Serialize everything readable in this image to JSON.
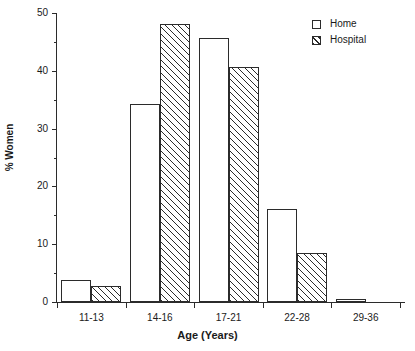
{
  "chart_data": {
    "type": "bar",
    "title": "",
    "subtitle": "",
    "xlabel": "Age (Years)",
    "ylabel": "% Women",
    "categories": [
      "11-13",
      "14-16",
      "17-21",
      "22-28",
      "29-36"
    ],
    "series": [
      {
        "name": "Home",
        "values": [
          3.8,
          34.3,
          45.7,
          16.1,
          0.5
        ],
        "fill": "none",
        "color": "#ffffff"
      },
      {
        "name": "Hospital",
        "values": [
          2.7,
          48.1,
          40.7,
          8.5,
          0.0
        ],
        "fill": "hatched",
        "color": "#ffffff"
      }
    ],
    "ylim": [
      0,
      50
    ],
    "ytick_labels": [
      "0",
      "10",
      "20",
      "30",
      "40",
      "50"
    ],
    "ytick_values": [
      0,
      10,
      20,
      30,
      40,
      50
    ],
    "yminor_values": [
      5,
      15,
      25,
      35,
      45
    ],
    "grid": false,
    "legend_position": "top-right",
    "line_color": "#2b2b2b",
    "background": "#ffffff"
  },
  "legend": {
    "entries": [
      {
        "label": "Home"
      },
      {
        "label": "Hospital"
      }
    ]
  },
  "axes": {
    "x_title": "Age (Years)",
    "y_title": "% Women"
  }
}
